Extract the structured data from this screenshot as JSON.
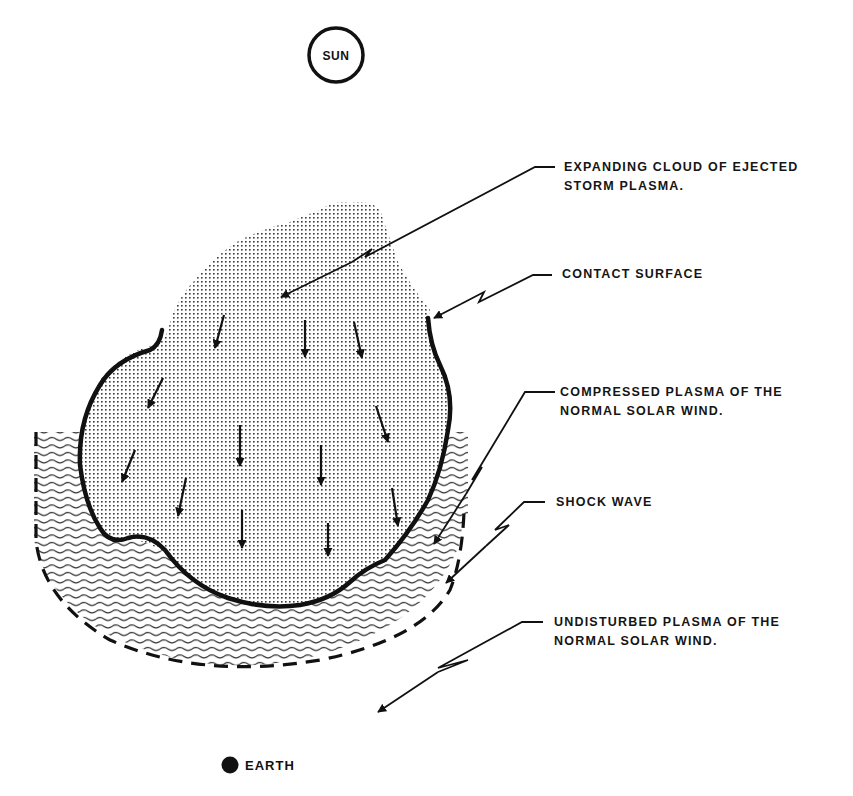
{
  "diagram": {
    "sun": {
      "label": "SUN"
    },
    "earth": {
      "label": "EARTH"
    },
    "labels": {
      "ejected_cloud": [
        "EXPANDING CLOUD  OF EJECTED",
        "STORM PLASMA."
      ],
      "contact_surface": [
        "CONTACT  SURFACE"
      ],
      "compressed_plasma": [
        "COMPRESSED PLASMA  OF  THE",
        "NORMAL  SOLAR  WIND."
      ],
      "shock_wave": [
        "SHOCK  WAVE"
      ],
      "undisturbed_plasma": [
        "UNDISTURBED  PLASMA  OF  THE",
        "NORMAL  SOLAR  WIND."
      ]
    },
    "colors": {
      "ink": "#111111",
      "background": "#ffffff",
      "stipple": "#3a3a3a"
    }
  }
}
